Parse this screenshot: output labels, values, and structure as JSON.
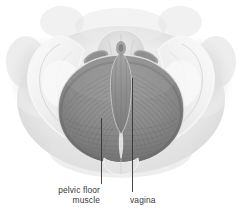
{
  "figure": {
    "name": "female-pelvic-floor-anatomy",
    "background_color": "#ffffff",
    "view": "superior view of female pelvis showing pelvic floor musculature"
  },
  "labels": [
    {
      "id": "pelvic-floor-muscle",
      "text": "pelvic floor\nmuscle",
      "line1": "pelvic floor",
      "line2": "muscle",
      "align": "right",
      "color": "#3a3a3a"
    },
    {
      "id": "vagina",
      "text": "vagina",
      "align": "left",
      "color": "#3a3a3a"
    }
  ],
  "leader_lines": [
    {
      "id": "leader-pelvic-floor-muscle",
      "x1": 101.5,
      "y1": 118,
      "x2": 101.5,
      "y2": 184,
      "color": "#333333",
      "width": 0.9
    },
    {
      "id": "leader-vagina",
      "x1": 132.5,
      "y1": 78,
      "x2": 132.5,
      "y2": 192,
      "color": "#333333",
      "width": 0.9
    }
  ],
  "palette": {
    "background": "#ffffff",
    "soft_tissue_outer": "#d8d8d8",
    "soft_tissue_mid": "#e6e6e6",
    "bone_light": "#f2f2f2",
    "bone_mid": "#e0e0e0",
    "bone_shadow": "#c9c9c9",
    "muscle_mid": "#8f8f8f",
    "muscle_dark": "#6f6f6f",
    "muscle_light": "#a8a8a8",
    "fiber_line": "#6a6a6a",
    "label_text": "#3a3a3a",
    "leader_line": "#333333"
  },
  "structures": [
    {
      "id": "soft-tissue-silhouette",
      "label": "body soft tissue outline"
    },
    {
      "id": "iliac-bone-left",
      "label": "left iliac bone"
    },
    {
      "id": "iliac-bone-right",
      "label": "right iliac bone"
    },
    {
      "id": "sacrum",
      "label": "sacrum"
    },
    {
      "id": "pubic-symphysis",
      "label": "pubic symphysis"
    },
    {
      "id": "obturator-foramen-left",
      "label": "left obturator foramen"
    },
    {
      "id": "obturator-foramen-right",
      "label": "right obturator foramen"
    },
    {
      "id": "levator-ani-left",
      "label": "left levator ani / pelvic floor muscle"
    },
    {
      "id": "levator-ani-right",
      "label": "right levator ani / pelvic floor muscle"
    },
    {
      "id": "vaginal-canal",
      "label": "vaginal canal"
    },
    {
      "id": "urethral-opening",
      "label": "urethral region"
    },
    {
      "id": "anococcygeal-raphe",
      "label": "anococcygeal raphe"
    }
  ]
}
